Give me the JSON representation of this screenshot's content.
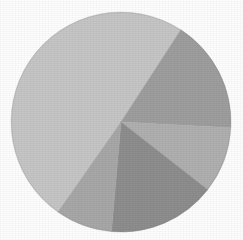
{
  "figure": {
    "title": "",
    "background_color": "#fefefe",
    "width": 243,
    "height": 240
  },
  "chart_data": {
    "type": "pie",
    "title": "",
    "subtitle": "",
    "xlabel": "",
    "ylabel": "",
    "legend": "none",
    "grid": false,
    "labels_shown": false,
    "start_angle_deg": 33,
    "direction": "clockwise",
    "center": {
      "x": 121,
      "y": 122
    },
    "radius": 110,
    "total": 100,
    "categories": [
      "Slice 1",
      "Slice 2",
      "Slice 3",
      "Slice 4",
      "Slice 5"
    ],
    "values": [
      49.4,
      16.7,
      9.7,
      15.8,
      8.4
    ],
    "colors": [
      "#c6c6c6",
      "#9e9e9e",
      "#b0b0b0",
      "#8e8e8e",
      "#a8a8a8"
    ],
    "slices": [
      {
        "name": "Slice 1",
        "value": 49.4,
        "percent": "49.4%",
        "color": "#c6c6c6",
        "start_angle_deg": 215,
        "end_angle_deg": 393
      },
      {
        "name": "Slice 2",
        "value": 16.7,
        "percent": "16.7%",
        "color": "#9e9e9e",
        "start_angle_deg": 33,
        "end_angle_deg": 93
      },
      {
        "name": "Slice 3",
        "value": 9.7,
        "percent": "9.7%",
        "color": "#b0b0b0",
        "start_angle_deg": 93,
        "end_angle_deg": 128
      },
      {
        "name": "Slice 4",
        "value": 15.8,
        "percent": "15.8%",
        "color": "#8e8e8e",
        "start_angle_deg": 128,
        "end_angle_deg": 185
      },
      {
        "name": "Slice 5",
        "value": 8.4,
        "percent": "8.4%",
        "color": "#a8a8a8",
        "start_angle_deg": 185,
        "end_angle_deg": 215
      }
    ]
  }
}
